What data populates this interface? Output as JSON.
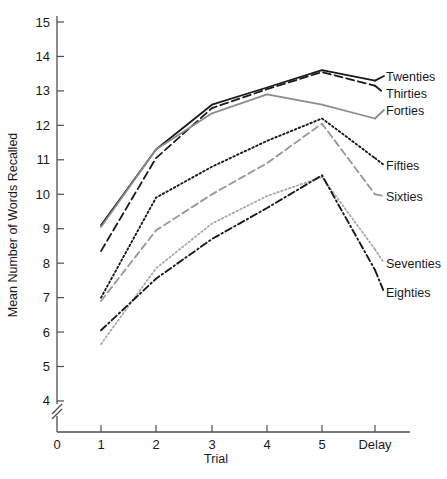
{
  "chart_data": {
    "type": "line",
    "title": "",
    "xlabel": "Trial",
    "ylabel": "Mean Number of Words Recalled",
    "categories": [
      "1",
      "2",
      "3",
      "4",
      "5",
      "Delay"
    ],
    "x_tick_labels": [
      "0",
      "1",
      "2",
      "3",
      "4",
      "5",
      "Delay"
    ],
    "y_tick_labels": [
      "4",
      "5",
      "6",
      "7",
      "8",
      "9",
      "10",
      "11",
      "12",
      "13",
      "14",
      "15"
    ],
    "ylim": [
      4,
      15
    ],
    "y_axis_break": true,
    "grid": false,
    "legend_position": "right-inline",
    "series": [
      {
        "name": "Twenties",
        "values": [
          9.1,
          11.3,
          12.6,
          13.1,
          13.6,
          13.3
        ],
        "color": "#1a1a1a",
        "dash": "none",
        "width": 1.8,
        "label_y": 76
      },
      {
        "name": "Thirties",
        "values": [
          8.35,
          11.05,
          12.5,
          13.05,
          13.55,
          13.15
        ],
        "color": "#1a1a1a",
        "dash": "8,4",
        "width": 1.8,
        "label_y": 93
      },
      {
        "name": "Forties",
        "values": [
          9.05,
          11.3,
          12.35,
          12.9,
          12.6,
          12.2
        ],
        "color": "#8c8c8c",
        "dash": "none",
        "width": 1.8,
        "label_y": 110
      },
      {
        "name": "Fifties",
        "values": [
          7.0,
          9.9,
          10.8,
          11.55,
          12.2,
          11.05
        ],
        "color": "#1a1a1a",
        "dash": "1.6,2.6",
        "width": 1.9,
        "label_y": 165
      },
      {
        "name": "Sixties",
        "values": [
          6.9,
          8.95,
          10.0,
          10.9,
          12.05,
          10.0
        ],
        "color": "#9a9a9a",
        "dash": "7,4",
        "width": 1.9,
        "label_y": 196
      },
      {
        "name": "Seventies",
        "values": [
          5.65,
          7.85,
          9.15,
          9.95,
          10.5,
          8.4
        ],
        "color": "#a8a8a8",
        "dash": "1.5,2.6",
        "width": 1.8,
        "label_y": 263
      },
      {
        "name": "Eighties",
        "values": [
          6.05,
          7.55,
          8.7,
          9.6,
          10.55,
          7.8
        ],
        "color": "#1a1a1a",
        "dash": "7,3,1.5,3",
        "width": 1.9,
        "label_y": 292
      }
    ],
    "axis_geometry": {
      "x_pixels": [
        101,
        156,
        212,
        267,
        322,
        375
      ],
      "x_origin_px": 57,
      "y_top_px": 22,
      "y_value_top": 15,
      "px_per_unit": 34.45,
      "axis_bottom_px": 432,
      "legend_x_px": 386
    }
  }
}
